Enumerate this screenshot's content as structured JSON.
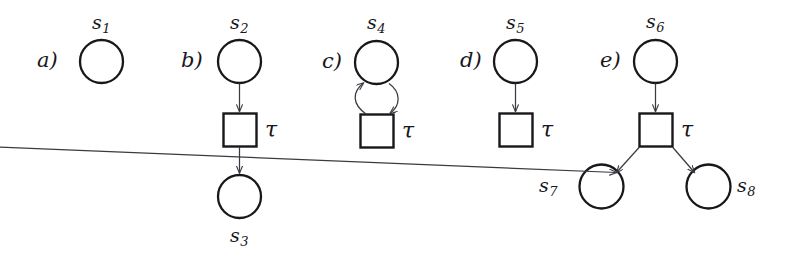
{
  "figure": {
    "caption": "",
    "background_color": "#ffffff",
    "stroke_color": "#17171c",
    "arrow_color": "#3a3a42",
    "node_fill": "#ffffff"
  },
  "panels": [
    {
      "id": "a",
      "label": "a)",
      "places": [
        {
          "name": "s1",
          "base": "s",
          "sub": "1",
          "label_position": "above"
        }
      ],
      "transitions": [],
      "arcs": []
    },
    {
      "id": "b",
      "label": "b)",
      "places": [
        {
          "name": "s2",
          "base": "s",
          "sub": "2",
          "label_position": "above"
        },
        {
          "name": "s3",
          "base": "s",
          "sub": "3",
          "label_position": "below"
        }
      ],
      "transitions": [
        {
          "name": "tau",
          "label": "τ",
          "label_position": "right"
        }
      ],
      "arcs": [
        {
          "from": "s2",
          "to": "tau",
          "shape": "straight",
          "direction": "down"
        },
        {
          "from": "tau",
          "to": "s3",
          "shape": "straight",
          "direction": "down"
        }
      ]
    },
    {
      "id": "c",
      "label": "c)",
      "places": [
        {
          "name": "s4",
          "base": "s",
          "sub": "4",
          "label_position": "above"
        }
      ],
      "transitions": [
        {
          "name": "tau",
          "label": "τ",
          "label_position": "right"
        }
      ],
      "arcs": [
        {
          "from": "tau",
          "to": "s4",
          "shape": "curved-left",
          "direction": "up"
        },
        {
          "from": "s4",
          "to": "tau",
          "shape": "curved-right",
          "direction": "down"
        }
      ]
    },
    {
      "id": "d",
      "label": "d)",
      "places": [
        {
          "name": "s5",
          "base": "s",
          "sub": "5",
          "label_position": "above"
        }
      ],
      "transitions": [
        {
          "name": "tau",
          "label": "τ",
          "label_position": "right"
        }
      ],
      "arcs": [
        {
          "from": "s5",
          "to": "tau",
          "shape": "straight",
          "direction": "down"
        }
      ]
    },
    {
      "id": "e",
      "label": "e)",
      "places": [
        {
          "name": "s6",
          "base": "s",
          "sub": "6",
          "label_position": "above"
        },
        {
          "name": "s7",
          "base": "s",
          "sub": "7",
          "label_position": "left"
        },
        {
          "name": "s8",
          "base": "s",
          "sub": "8",
          "label_position": "right"
        }
      ],
      "transitions": [
        {
          "name": "tau",
          "label": "τ",
          "label_position": "right"
        }
      ],
      "arcs": [
        {
          "from": "s6",
          "to": "tau",
          "shape": "straight",
          "direction": "down"
        },
        {
          "from": "tau",
          "to": "s7",
          "shape": "diagonal",
          "direction": "down-left"
        },
        {
          "from": "tau",
          "to": "s8",
          "shape": "diagonal",
          "direction": "down-right"
        }
      ]
    }
  ],
  "labels": {
    "a_panel": "a)",
    "b_panel": "b)",
    "c_panel": "c)",
    "d_panel": "d)",
    "e_panel": "e)",
    "s1_base": "s",
    "s1_sub": "1",
    "s2_base": "s",
    "s2_sub": "2",
    "s3_base": "s",
    "s3_sub": "3",
    "s4_base": "s",
    "s4_sub": "4",
    "s5_base": "s",
    "s5_sub": "5",
    "s6_base": "s",
    "s6_sub": "6",
    "s7_base": "s",
    "s7_sub": "7",
    "s8_base": "s",
    "s8_sub": "8",
    "tau_b": "τ",
    "tau_c": "τ",
    "tau_d": "τ",
    "tau_e": "τ"
  }
}
